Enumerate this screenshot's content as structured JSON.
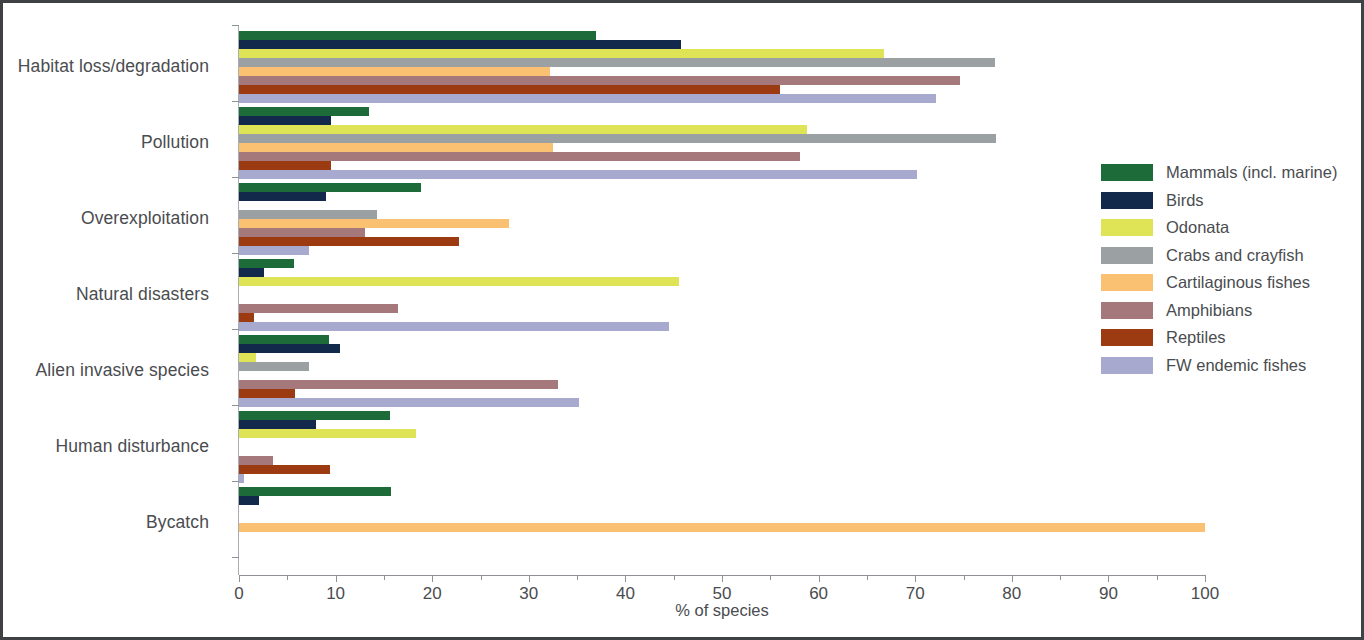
{
  "figure": {
    "border_color": "#3f4144",
    "background": "#ffffff"
  },
  "axis": {
    "x_title": "% of species",
    "x_ticks": [
      "0",
      "10",
      "20",
      "30",
      "40",
      "50",
      "60",
      "70",
      "80",
      "90",
      "100"
    ]
  },
  "legend": {
    "items": [
      {
        "label": "Mammals (incl. marine)",
        "color": "#1e6b3a"
      },
      {
        "label": "Birds",
        "color": "#13294b"
      },
      {
        "label": "Odonata",
        "color": "#dfe356"
      },
      {
        "label": "Crabs and crayfish",
        "color": "#9ba0a2"
      },
      {
        "label": "Cartilaginous fishes",
        "color": "#fbc173"
      },
      {
        "label": "Amphibians",
        "color": "#a5797c"
      },
      {
        "label": "Reptiles",
        "color": "#9c3a11"
      },
      {
        "label": "FW endemic fishes",
        "color": "#a8a9ce"
      }
    ]
  },
  "chart_data": {
    "type": "bar",
    "orientation": "horizontal",
    "title": "",
    "xlabel": "% of species",
    "ylabel": "",
    "xlim": [
      0,
      100
    ],
    "grid": false,
    "legend_position": "right",
    "categories": [
      "Habitat loss/degradation",
      "Pollution",
      "Overexploitation",
      "Natural disasters",
      "Alien invasive species",
      "Human disturbance",
      "Bycatch"
    ],
    "series": [
      {
        "name": "Mammals (incl. marine)",
        "color": "#1e6b3a",
        "values": [
          37.0,
          13.5,
          18.8,
          5.7,
          9.3,
          15.6,
          15.7
        ]
      },
      {
        "name": "Birds",
        "color": "#13294b",
        "values": [
          45.8,
          9.5,
          9.0,
          2.6,
          10.5,
          8.0,
          2.1
        ]
      },
      {
        "name": "Odonata",
        "color": "#dfe356",
        "values": [
          66.8,
          58.8,
          0,
          45.5,
          1.8,
          18.3,
          0
        ]
      },
      {
        "name": "Crabs and crayfish",
        "color": "#9ba0a2",
        "values": [
          78.3,
          78.4,
          14.3,
          0,
          7.2,
          0,
          0
        ]
      },
      {
        "name": "Cartilaginous fishes",
        "color": "#fbc173",
        "values": [
          32.2,
          32.5,
          28.0,
          0,
          0,
          0,
          100.0
        ]
      },
      {
        "name": "Amphibians",
        "color": "#a5797c",
        "values": [
          74.6,
          58.1,
          13.0,
          16.5,
          33.0,
          3.5,
          0
        ]
      },
      {
        "name": "Reptiles",
        "color": "#9c3a11",
        "values": [
          56.0,
          9.5,
          22.8,
          1.6,
          5.8,
          9.4,
          0
        ]
      },
      {
        "name": "FW endemic fishes",
        "color": "#a8a9ce",
        "values": [
          72.2,
          70.2,
          7.2,
          44.5,
          35.2,
          0.5,
          0
        ]
      }
    ]
  }
}
